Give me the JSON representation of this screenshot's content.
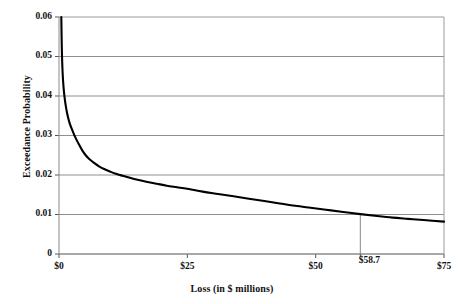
{
  "chart_data": {
    "type": "line",
    "title": "",
    "xlabel": "Loss (in $ millions)",
    "ylabel": "Exceedance Probability",
    "xlim": [
      0,
      75
    ],
    "ylim": [
      0,
      0.06
    ],
    "grid": "horizontal",
    "legend": "none",
    "x_tick_labels": [
      "$0",
      "$25",
      "$50",
      "$75"
    ],
    "x_tick_values": [
      0,
      25,
      50,
      75
    ],
    "y_tick_labels": [
      "0",
      "0.01",
      "0.02",
      "0.03",
      "0.04",
      "0.05",
      "0.06"
    ],
    "y_tick_values": [
      0,
      0.01,
      0.02,
      0.03,
      0.04,
      0.05,
      0.06
    ],
    "annotations": [
      {
        "label": "$58.7",
        "x": 58.7,
        "y": 0.0101,
        "type": "vertical-drop-line"
      }
    ],
    "series": [
      {
        "name": "Exceedance probability curve",
        "color": "#000000",
        "points": [
          [
            0.45,
            0.06
          ],
          [
            0.55,
            0.052
          ],
          [
            0.7,
            0.046
          ],
          [
            0.9,
            0.042
          ],
          [
            1.2,
            0.0385
          ],
          [
            1.6,
            0.0355
          ],
          [
            2.1,
            0.033
          ],
          [
            2.7,
            0.031
          ],
          [
            3.3,
            0.0292
          ],
          [
            3.9,
            0.0277
          ],
          [
            4.5,
            0.0263
          ],
          [
            5.2,
            0.025
          ],
          [
            6.0,
            0.0239
          ],
          [
            6.9,
            0.023
          ],
          [
            7.8,
            0.0222
          ],
          [
            8.8,
            0.0215
          ],
          [
            9.9,
            0.0209
          ],
          [
            11.1,
            0.0203
          ],
          [
            12.4,
            0.0198
          ],
          [
            13.8,
            0.0193
          ],
          [
            15.3,
            0.0188
          ],
          [
            17.0,
            0.0183
          ],
          [
            19.0,
            0.0178
          ],
          [
            21.0,
            0.0173
          ],
          [
            23.0,
            0.0169
          ],
          [
            25.0,
            0.0165
          ],
          [
            28.0,
            0.0158
          ],
          [
            31.0,
            0.0152
          ],
          [
            34.0,
            0.0146
          ],
          [
            37.0,
            0.014
          ],
          [
            40.0,
            0.0134
          ],
          [
            43.0,
            0.0128
          ],
          [
            46.0,
            0.0122
          ],
          [
            49.0,
            0.0117
          ],
          [
            52.0,
            0.0112
          ],
          [
            55.0,
            0.0107
          ],
          [
            58.7,
            0.0101
          ],
          [
            62.0,
            0.0096
          ],
          [
            65.0,
            0.0092
          ],
          [
            68.0,
            0.0089
          ],
          [
            71.0,
            0.0086
          ],
          [
            75.0,
            0.0082
          ]
        ]
      }
    ]
  }
}
